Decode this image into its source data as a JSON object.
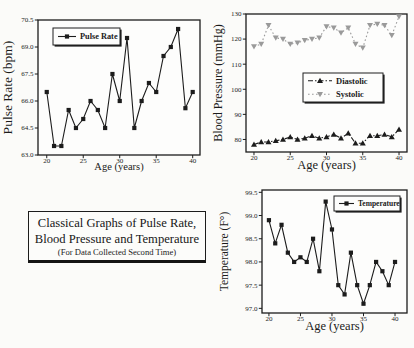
{
  "figure": {
    "caption_line1": "Classical Graphs of Pulse Rate,",
    "caption_line2": "Blood Pressure and Temperature",
    "caption_line3": "(For Data Collected Second Time)"
  },
  "colors": {
    "axis": "#1c1c1c",
    "black_series": "#1c1c1c",
    "gray_series": "#9a9a9a",
    "background": "#fbfbf9",
    "plot_background": "#fdfdfc"
  },
  "chart_data": [
    {
      "id": "pulse-rate",
      "type": "line",
      "title": "",
      "xlabel": "Age (years)",
      "ylabel": "Pulse Rate (bpm)",
      "x": [
        20,
        21,
        22,
        23,
        24,
        25,
        26,
        27,
        28,
        29,
        30,
        31,
        32,
        33,
        34,
        35,
        36,
        37,
        38,
        39,
        40
      ],
      "series": [
        {
          "name": "Pulse Rate",
          "marker": "square",
          "line": "solid",
          "color": "#1c1c1c",
          "values": [
            66.5,
            63.5,
            63.5,
            65.5,
            64.5,
            65.0,
            66.0,
            65.5,
            64.5,
            67.5,
            66.0,
            69.5,
            64.5,
            66.0,
            67.0,
            66.5,
            68.5,
            69.0,
            70.0,
            65.6,
            66.5
          ]
        }
      ],
      "xlim": [
        18.8,
        41.0
      ],
      "ylim": [
        63.0,
        70.5
      ],
      "xticks": [
        20,
        25,
        30,
        35,
        40
      ],
      "xtick_labels": [
        "20",
        "25",
        "30",
        "35",
        "40"
      ],
      "yticks": [
        63.0,
        64.5,
        66.0,
        67.5,
        69.0,
        70.5
      ],
      "ytick_labels": [
        "63.0",
        "64.5",
        "66.0",
        "67.5",
        "69.0",
        "70.5"
      ],
      "grid": false,
      "legend_position": "upper-left",
      "layout": {
        "rect": {
          "x": 38,
          "y": 20,
          "w": 162,
          "h": 135
        },
        "tickFont": 7,
        "xlabelFont": 10.5,
        "ylabelFont": 13.5,
        "tickOffset": 7.5,
        "xlabelOffset": 14.5,
        "ylabelOffset": 26,
        "legend": {
          "x": 53,
          "y": 28,
          "w": 67,
          "h": 17,
          "rowH": 15,
          "sample": 18,
          "font": 8.3
        }
      }
    },
    {
      "id": "blood-pressure",
      "type": "line",
      "title": "",
      "xlabel": "Age (years)",
      "ylabel": "Blood Pressure (mmHg)",
      "x": [
        20,
        21,
        22,
        23,
        24,
        25,
        26,
        27,
        28,
        29,
        30,
        31,
        32,
        33,
        34,
        35,
        36,
        37,
        38,
        39,
        40
      ],
      "series": [
        {
          "name": "Diastolic",
          "marker": "triangle-up",
          "line": "dashdot",
          "color": "#1c1c1c",
          "values": [
            78,
            79,
            79,
            79.5,
            80,
            81,
            80,
            80.5,
            81.5,
            80.5,
            81,
            82,
            80.5,
            82.5,
            78.5,
            78.5,
            81.5,
            81.5,
            82,
            81,
            84
          ]
        },
        {
          "name": "Systolic",
          "marker": "triangle-down",
          "line": "dotted",
          "color": "#9a9a9a",
          "values": [
            117,
            118,
            125.5,
            120.5,
            120,
            118,
            118.5,
            119.5,
            120,
            120.5,
            125,
            124.5,
            122.5,
            124.5,
            118,
            116.5,
            125.5,
            126,
            125.5,
            121.5,
            129
          ]
        }
      ],
      "xlim": [
        18.9,
        41.1
      ],
      "ylim": [
        75,
        130
      ],
      "xticks": [
        20,
        25,
        30,
        35,
        40
      ],
      "xtick_labels": [
        "20",
        "25",
        "30",
        "35",
        "40"
      ],
      "yticks": [
        80,
        90,
        100,
        110,
        120,
        130
      ],
      "ytick_labels": [
        "80",
        "90",
        "100",
        "110",
        "120",
        "130"
      ],
      "grid": false,
      "legend_position": "center-right",
      "layout": {
        "rect": {
          "x": 246,
          "y": 14,
          "w": 161,
          "h": 138
        },
        "tickFont": 7,
        "xlabelFont": 12.5,
        "ylabelFont": 12,
        "tickOffset": 8,
        "xlabelOffset": 16.5,
        "ylabelOffset": 24,
        "legend": {
          "x": 303,
          "y": 73,
          "w": 80,
          "h": 29,
          "rowH": 13.5,
          "sample": 24,
          "font": 8.5
        }
      }
    },
    {
      "id": "temperature",
      "type": "line",
      "title": "",
      "xlabel": "Age (years)",
      "ylabel": "Temperature (F°)",
      "x": [
        20,
        21,
        22,
        23,
        24,
        25,
        26,
        27,
        28,
        29,
        30,
        31,
        32,
        33,
        34,
        35,
        36,
        37,
        38,
        39,
        40
      ],
      "series": [
        {
          "name": "Temperature",
          "marker": "square",
          "line": "solid",
          "color": "#1c1c1c",
          "values": [
            98.9,
            98.4,
            98.8,
            98.2,
            98.0,
            98.1,
            98.0,
            98.5,
            97.8,
            99.3,
            98.7,
            97.5,
            97.3,
            98.2,
            97.5,
            97.1,
            97.5,
            98.0,
            97.8,
            97.5,
            98.0
          ]
        }
      ],
      "xlim": [
        18.9,
        41.9
      ],
      "ylim": [
        96.9,
        99.55
      ],
      "xticks": [
        20,
        25,
        30,
        35,
        40
      ],
      "xtick_labels": [
        "20",
        "25",
        "30",
        "35",
        "40"
      ],
      "yticks": [
        97.0,
        97.5,
        98.0,
        98.5,
        99.0,
        99.5
      ],
      "ytick_labels": [
        "97.0",
        "97.5",
        "98.0",
        "98.5",
        "99.0",
        "99.5"
      ],
      "grid": false,
      "legend_position": "upper-right",
      "layout": {
        "rect": {
          "x": 262,
          "y": 190,
          "w": 145,
          "h": 123
        },
        "tickFont": 7,
        "xlabelFont": 12.5,
        "ylabelFont": 11.5,
        "tickOffset": 8,
        "xlabelOffset": 16.5,
        "ylabelOffset": 34,
        "legend": {
          "x": 334,
          "y": 196,
          "w": 66,
          "h": 15,
          "rowH": 13,
          "sample": 15,
          "font": 7.5
        }
      }
    }
  ]
}
